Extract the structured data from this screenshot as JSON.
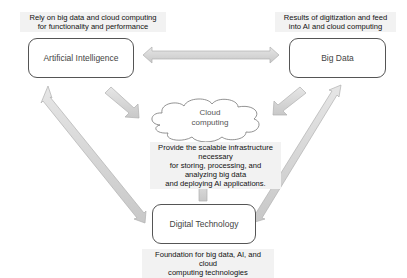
{
  "nodes": {
    "ai": {
      "label": "Artificial Intelligence",
      "caption_line1": "Rely on big data and cloud computing",
      "caption_line2": "for functionality and performance"
    },
    "big_data": {
      "label": "Big Data",
      "caption_line1": "Results of digitization and feed",
      "caption_line2": "into AI and cloud computing"
    },
    "cloud": {
      "label_line1": "Cloud",
      "label_line2": "computing",
      "caption_line1": "Provide the scalable infrastructure necessary",
      "caption_line2": "for storing, processing, and analyzing  big data",
      "caption_line3": "and deploying AI applications."
    },
    "digital_tech": {
      "label": "Digital Technology",
      "caption_line1": "Foundation for big data, AI, and cloud",
      "caption_line2": "computing technologies"
    }
  },
  "colors": {
    "arrow_fill": "#d9d9d9",
    "arrow_stroke": "#a6a6a6",
    "box_border": "#555555",
    "caption_bg": "#f2f2f2"
  }
}
